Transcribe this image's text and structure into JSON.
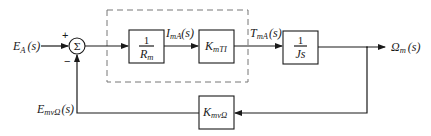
{
  "diagram": {
    "type": "block-diagram",
    "input": {
      "symbol": "E",
      "sub": "A",
      "arg": "(s)"
    },
    "summing_junction": {
      "symbol": "Σ",
      "plus_sign": "+",
      "minus_sign": "−"
    },
    "blocks": {
      "inv_resistance": {
        "num": "1",
        "den_symbol": "R",
        "den_sub": "m"
      },
      "torque_const": {
        "symbol": "K",
        "sub": "mTI"
      },
      "inertia": {
        "num": "1",
        "den": "Js"
      },
      "feedback": {
        "symbol": "K",
        "sub": "mvΩ"
      }
    },
    "signals": {
      "current": {
        "symbol": "I",
        "sub": "mA",
        "arg": "(s)"
      },
      "torque": {
        "symbol": "T",
        "sub": "mA",
        "arg": "(s)"
      },
      "output": {
        "symbol": "Ω",
        "sub": "m",
        "arg": "(s)"
      },
      "back_emf": {
        "symbol": "E",
        "sub": "mvΩ",
        "arg": "(s)"
      }
    },
    "colors": {
      "line": "#1a1a1a",
      "dashed_box": "#777777",
      "background": "#ffffff"
    }
  }
}
